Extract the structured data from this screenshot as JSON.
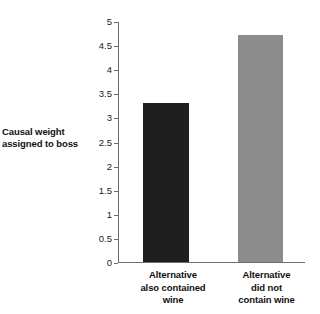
{
  "chart_data": {
    "type": "bar",
    "title": "",
    "subtitle": "",
    "xlabel": "",
    "ylabel": "Causal weight\nassigned to boss",
    "ylabel_lines": [
      "Causal weight",
      "assigned to boss"
    ],
    "categories": [
      "Alternative also contained wine",
      "Alternative did not contain wine"
    ],
    "category_lines": [
      [
        "Alternative",
        "also contained",
        "wine"
      ],
      [
        "Alternative",
        "did not",
        "contain wine"
      ]
    ],
    "values": [
      3.3,
      4.7
    ],
    "ylim": [
      0,
      5
    ],
    "ytick_step": 0.5,
    "yticks": [
      0,
      0.5,
      1,
      1.5,
      2,
      2.5,
      3,
      3.5,
      4,
      4.5,
      5
    ],
    "ytick_labels": [
      "0",
      "0.5",
      "1",
      "1.5",
      "2",
      "2.5",
      "3",
      "3.5",
      "4",
      "4.5",
      "5"
    ],
    "grid": false,
    "legend": null,
    "bar_colors": [
      "#1f1f1f",
      "#8c8c8c"
    ],
    "axis_color": "#6e6e6e",
    "background": "#ffffff"
  }
}
